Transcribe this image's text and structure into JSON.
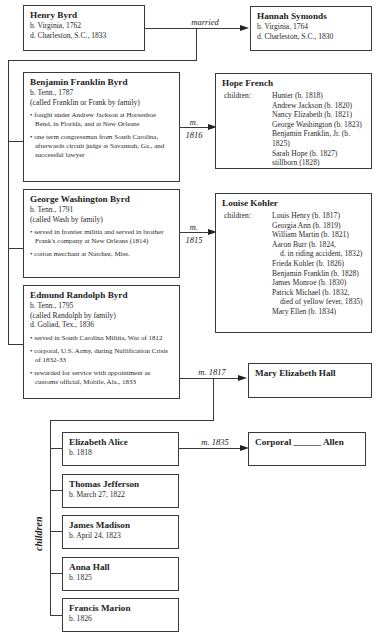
{
  "henry": {
    "name": "Henry Byrd",
    "lines": [
      "b. Virginia, 1762",
      "d. Charleston, S.C., 1833"
    ]
  },
  "hannah": {
    "name": "Hannah Symonds",
    "lines": [
      "b. Virginia, 1764",
      "d. Charleston, S.C., 1830"
    ]
  },
  "married_label": "married",
  "benjamin": {
    "name": "Benjamin Franklin Byrd",
    "lines": [
      "b. Tenn., 1787",
      "(called Franklin or Frank by family)"
    ],
    "bullets": [
      "fought under Andrew Jackson at Horseshoe Bend, in Florida, and at New Orleans",
      "one term congressman from South Carolina, afterwards circuit judge at Savannah, Ga., and successful lawyer"
    ],
    "marriage": {
      "m": "m.",
      "year": "1816"
    }
  },
  "hope": {
    "name": "Hope French",
    "children_label": "children:",
    "children": [
      "Hunter (b. 1818)",
      "Andrew Jackson (b. 1820)",
      "Nancy Elizabeth (b. 1821)",
      "George Washington (b. 1823)",
      "Benjamin Franklin, Jr. (b. 1825)",
      "Sarah Hope (b. 1827)",
      "stillborn (1828)"
    ]
  },
  "george": {
    "name": "George Washington Byrd",
    "lines": [
      "b. Tenn., 1791",
      "(called Wash by family)"
    ],
    "bullets": [
      "served in frontier militia and served in brother Frank's company at New Orleans (1814)",
      "cotton merchant at Natchez, Miss."
    ],
    "marriage": {
      "m": "m.",
      "year": "1815"
    }
  },
  "louise": {
    "name": "Louise Kohler",
    "children_label": "children:",
    "children": [
      "Louis Henry (b. 1817)",
      "Georgia Ann (b. 1819)",
      "William Martin (b. 1821)",
      "Aaron Burr (b. 1824,",
      "d. in riding accident, 1832)",
      "Frieda Kohler (b. 1826)",
      "Benjamin Franklin (b. 1828)",
      "James Monroe (b. 1830)",
      "Patrick Michael (b. 1832,",
      "died of yellow fever, 1835)",
      "Mary Ellen (b. 1834)"
    ]
  },
  "edmund": {
    "name": "Edmund Randolph Byrd",
    "lines": [
      "b. Tenn., 1795",
      "(called Randolph by family)",
      "d. Goliad, Tex., 1836"
    ],
    "bullets": [
      "served in South Carolina Militia, War of 1812",
      "corporal, U.S. Army, during Nullification Crisis of 1832-33",
      "rewarded for service with appointment as customs official, Mobile, Ala., 1833"
    ],
    "marriage": "m. 1817"
  },
  "mary": {
    "name": "Mary Elizabeth Hall"
  },
  "children_label": "children",
  "elizabeth": {
    "name": "Elizabeth Alice",
    "lines": [
      "b. 1818"
    ],
    "marriage": "m. 1835"
  },
  "allen": {
    "name": "Corporal ______ Allen"
  },
  "thomas": {
    "name": "Thomas Jefferson",
    "lines": [
      "b. March 27, 1822"
    ]
  },
  "james": {
    "name": "James Madison",
    "lines": [
      "b. April 24, 1823"
    ]
  },
  "anna": {
    "name": "Anna Hall",
    "lines": [
      "b. 1825"
    ]
  },
  "francis": {
    "name": "Francis Marion",
    "lines": [
      "b. 1826"
    ]
  }
}
